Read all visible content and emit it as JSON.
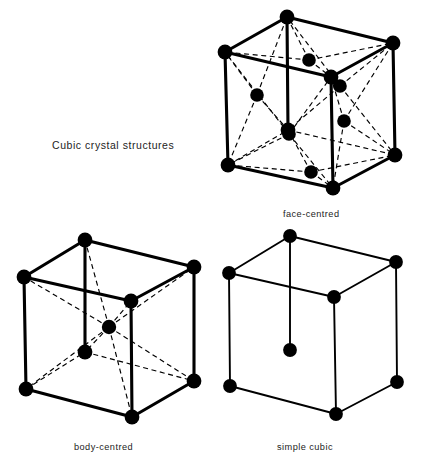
{
  "figure": {
    "title": "Cubic crystal structures",
    "background_color": "#ffffff",
    "ink_color": "#000000",
    "text_color": "#232323"
  },
  "structures": [
    {
      "id": "face-centred",
      "label": "face-centred",
      "position": "top-right",
      "atom_count_drawn": 14,
      "corner_atoms": 8,
      "face_atoms": 6,
      "edge_style": "solid-thick",
      "internal_style": "dashed",
      "label_x": 283,
      "label_y": 209
    },
    {
      "id": "body-centred",
      "label": "body-centred",
      "position": "bottom-left",
      "atom_count_drawn": 9,
      "corner_atoms": 8,
      "body_atoms": 1,
      "edge_style": "solid-thick",
      "internal_style": "dashed",
      "label_x": 74,
      "label_y": 442
    },
    {
      "id": "simple-cubic",
      "label": "simple cubic",
      "position": "bottom-right",
      "atom_count_drawn": 8,
      "corner_atoms": 8,
      "edge_style": "solid-thin",
      "internal_style": "none",
      "label_x": 277,
      "label_y": 442
    }
  ],
  "geometry": {
    "face_centred": {
      "corners": {
        "top_back": [
          287,
          17
        ],
        "top_left": [
          225,
          52
        ],
        "top_right": [
          393,
          43
        ],
        "top_front": [
          331,
          77
        ],
        "bot_back": [
          288,
          130
        ],
        "bot_left": [
          228,
          165
        ],
        "bot_right": [
          395,
          155
        ],
        "bot_front": [
          333,
          188
        ]
      },
      "face_centres": {
        "top_face": [
          309,
          60
        ],
        "bottom_face": [
          311,
          172
        ],
        "left_face": [
          257,
          95
        ],
        "right_face": [
          344,
          121
        ],
        "front_face": [
          289,
          134
        ],
        "back_face": [
          340,
          86
        ]
      }
    },
    "body_centred": {
      "corners": {
        "top_back": [
          85,
          240
        ],
        "top_left": [
          24,
          277
        ],
        "top_right": [
          194,
          267
        ],
        "top_front": [
          131,
          301
        ],
        "bot_back": [
          85,
          352
        ],
        "bot_left": [
          26,
          389
        ],
        "bot_right": [
          194,
          381
        ],
        "bot_front": [
          132,
          417
        ]
      },
      "body_centre": [
        109,
        327
      ]
    },
    "simple_cubic": {
      "corners": {
        "top_back": [
          290,
          236
        ],
        "top_left": [
          229,
          273
        ],
        "top_right": [
          396,
          262
        ],
        "top_front": [
          334,
          297
        ],
        "bot_back": [
          290,
          350
        ],
        "bot_left": [
          230,
          386
        ],
        "bot_right": [
          397,
          382
        ],
        "bot_front": [
          336,
          414
        ]
      }
    }
  }
}
